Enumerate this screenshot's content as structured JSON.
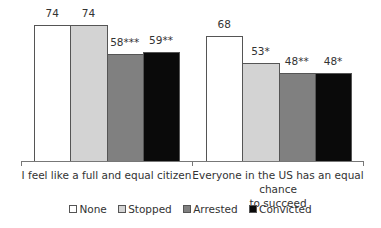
{
  "chart_data": {
    "type": "bar",
    "title": "",
    "xlabel": "",
    "ylabel": "",
    "ylim": [
      0,
      80
    ],
    "grid": false,
    "legend_position": "bottom",
    "categories": [
      "I feel like a full and equal citizen",
      "Everyone in the US has an equal chance to succeed"
    ],
    "series": [
      {
        "name": "None",
        "color": "#ffffff",
        "values": [
          74,
          68
        ],
        "labels": [
          "74",
          "68"
        ]
      },
      {
        "name": "Stopped",
        "color": "#d3d3d3",
        "values": [
          74,
          53
        ],
        "labels": [
          "74",
          "53*"
        ]
      },
      {
        "name": "Arrested",
        "color": "#808080",
        "values": [
          58,
          48
        ],
        "labels": [
          "58***",
          "48**"
        ]
      },
      {
        "name": "Convicted",
        "color": "#0a0a0a",
        "values": [
          59,
          48
        ],
        "labels": [
          "59**",
          "48*"
        ]
      }
    ]
  },
  "categories_display": [
    {
      "line1": "I feel like a full and equal citizen",
      "line2": ""
    },
    {
      "line1": "Everyone in the US has an equal chance",
      "line2": "to succeed"
    }
  ],
  "legend": [
    {
      "label": "None",
      "color": "#ffffff"
    },
    {
      "label": "Stopped",
      "color": "#d3d3d3"
    },
    {
      "label": "Arrested",
      "color": "#808080"
    },
    {
      "label": "Convicted",
      "color": "#0a0a0a"
    }
  ]
}
